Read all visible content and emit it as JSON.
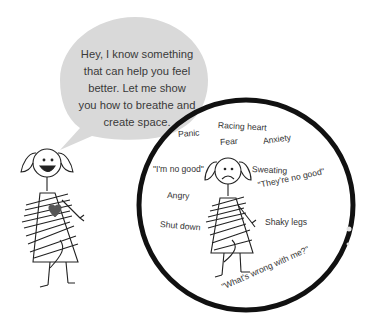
{
  "speech_bubble": {
    "text": "Hey, I know something that can help you feel better. Let me show you how to breathe and create space.",
    "lines": [
      "Hey, I know something",
      "that can help you feel",
      "better. Let me show",
      "you how to breathe and",
      "create space."
    ],
    "fill_color": "#d9d9d9"
  },
  "circle": {
    "border_color": "#111111",
    "labels": [
      {
        "text": "Panic",
        "x": 178,
        "y": 135,
        "rot": -4
      },
      {
        "text": "Racing heart",
        "x": 218,
        "y": 126,
        "rot": 3
      },
      {
        "text": "Fear",
        "x": 220,
        "y": 143,
        "rot": -4
      },
      {
        "text": "Anxiety",
        "x": 263,
        "y": 142,
        "rot": -8
      },
      {
        "text": "\"I'm no good\"",
        "x": 153,
        "y": 170,
        "rot": 0
      },
      {
        "text": "Sweating",
        "x": 252,
        "y": 170,
        "rot": 3
      },
      {
        "text": "\"They're no good\"",
        "x": 258,
        "y": 186,
        "rot": -12
      },
      {
        "text": "Angry",
        "x": 167,
        "y": 196,
        "rot": 2
      },
      {
        "text": "Shut down",
        "x": 160,
        "y": 225,
        "rot": 5
      },
      {
        "text": "Shaky legs",
        "x": 265,
        "y": 223,
        "rot": 0
      },
      {
        "text": "\"What's wrong with me?\"",
        "x": 222,
        "y": 288,
        "rot": -24
      }
    ]
  },
  "figures": {
    "happy_girl": {
      "expression": "smiling",
      "heart_color": "#555555"
    },
    "sad_girl": {
      "expression": "frowning"
    }
  }
}
